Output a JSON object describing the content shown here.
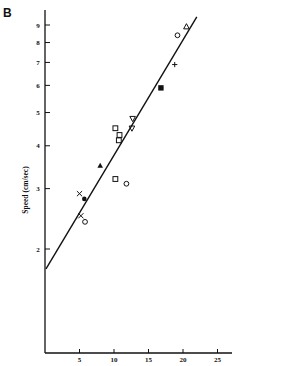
{
  "panel": {
    "label": "B"
  },
  "chart_data": {
    "type": "scatter",
    "title": "",
    "xlabel": "",
    "ylabel": "Speed (cm/sec)",
    "yscale": "log",
    "xlim": [
      0,
      27
    ],
    "ylim": [
      1.0,
      10.5
    ],
    "x_ticks": [
      5,
      10,
      15,
      20,
      25
    ],
    "y_ticks": [
      2,
      3,
      4,
      5,
      6,
      7,
      8,
      9
    ],
    "grid": false,
    "legend": null,
    "series": [
      {
        "name": "cross",
        "marker": "x",
        "points": [
          [
            5.0,
            2.9
          ],
          [
            5.2,
            2.5
          ]
        ]
      },
      {
        "name": "filled-circle",
        "marker": "filled-circle",
        "points": [
          [
            5.7,
            2.8
          ]
        ]
      },
      {
        "name": "open-circle",
        "marker": "open-circle",
        "points": [
          [
            5.8,
            2.4
          ],
          [
            11.8,
            3.1
          ],
          [
            19.2,
            8.4
          ]
        ]
      },
      {
        "name": "filled-triangle",
        "marker": "filled-triangle",
        "points": [
          [
            8.0,
            3.5
          ]
        ]
      },
      {
        "name": "open-square",
        "marker": "open-square",
        "points": [
          [
            10.2,
            3.2
          ],
          [
            10.2,
            4.5
          ],
          [
            10.8,
            4.3
          ],
          [
            10.7,
            4.15
          ]
        ]
      },
      {
        "name": "open-down-triangle",
        "marker": "open-down-triangle",
        "points": [
          [
            12.7,
            4.8
          ],
          [
            12.6,
            4.5
          ]
        ]
      },
      {
        "name": "filled-square",
        "marker": "filled-square",
        "points": [
          [
            16.8,
            5.9
          ]
        ]
      },
      {
        "name": "plus",
        "marker": "plus",
        "points": [
          [
            18.8,
            6.9
          ]
        ]
      },
      {
        "name": "open-triangle",
        "marker": "open-triangle",
        "points": [
          [
            20.5,
            8.9
          ]
        ]
      }
    ],
    "fit_line": {
      "x": [
        0,
        22
      ],
      "y": [
        1.75,
        9.5
      ]
    }
  }
}
